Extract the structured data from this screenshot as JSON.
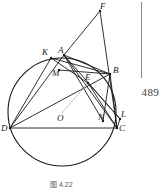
{
  "figure": {
    "caption": "图 4.22",
    "page_number": "489",
    "points": [
      {
        "id": "F",
        "label": "F",
        "x": 100,
        "y": 11,
        "lx": 100,
        "ly": 2,
        "kind": "external-apex"
      },
      {
        "id": "K",
        "label": "K",
        "x": 51,
        "y": 58,
        "lx": 42,
        "ly": 48,
        "kind": "on-circle"
      },
      {
        "id": "A",
        "label": "A",
        "x": 64,
        "y": 55,
        "lx": 58,
        "ly": 46,
        "kind": "on-circle"
      },
      {
        "id": "B",
        "label": "B",
        "x": 110,
        "y": 74,
        "lx": 113,
        "ly": 66,
        "kind": "on-circle"
      },
      {
        "id": "M",
        "label": "M",
        "x": 59,
        "y": 70,
        "lx": 52,
        "ly": 69,
        "kind": "interior"
      },
      {
        "id": "E",
        "label": "E",
        "x": 88,
        "y": 83,
        "lx": 85,
        "ly": 73,
        "kind": "interior"
      },
      {
        "id": "O",
        "label": "O",
        "x": 62,
        "y": 113,
        "lx": 57,
        "ly": 114,
        "kind": "center"
      },
      {
        "id": "N",
        "label": "N",
        "x": 103,
        "y": 121,
        "lx": 98,
        "ly": 113,
        "kind": "interior"
      },
      {
        "id": "L",
        "label": "L",
        "x": 120,
        "y": 119,
        "lx": 121,
        "ly": 110,
        "kind": "external"
      },
      {
        "id": "C",
        "label": "C",
        "x": 117,
        "y": 128,
        "lx": 119,
        "ly": 124,
        "kind": "on-circle"
      },
      {
        "id": "D",
        "label": "D",
        "x": 10,
        "y": 128,
        "lx": 1,
        "ly": 124,
        "kind": "on-circle"
      }
    ],
    "circle": {
      "cx": 62,
      "cy": 112,
      "r": 54,
      "label": "circumcircle"
    },
    "segments": [
      {
        "from": "F",
        "to": "A",
        "style": "solid"
      },
      {
        "from": "F",
        "to": "C",
        "style": "solid"
      },
      {
        "from": "A",
        "to": "B",
        "style": "solid"
      },
      {
        "from": "A",
        "to": "C",
        "style": "solid"
      },
      {
        "from": "A",
        "to": "N",
        "style": "solid"
      },
      {
        "from": "A",
        "to": "L",
        "style": "solid"
      },
      {
        "from": "A",
        "to": "D",
        "style": "solid"
      },
      {
        "from": "K",
        "to": "E",
        "style": "solid"
      },
      {
        "from": "K",
        "to": "B",
        "style": "solid"
      },
      {
        "from": "D",
        "to": "C",
        "style": "solid"
      },
      {
        "from": "D",
        "to": "B",
        "style": "solid"
      },
      {
        "from": "D",
        "to": "K",
        "style": "solid"
      },
      {
        "from": "B",
        "to": "C",
        "style": "solid"
      },
      {
        "from": "B",
        "to": "N",
        "style": "solid"
      },
      {
        "from": "E",
        "to": "C",
        "style": "solid"
      },
      {
        "from": "E",
        "to": "L",
        "style": "solid"
      },
      {
        "from": "M",
        "to": "B",
        "style": "solid"
      },
      {
        "from": "C",
        "to": "L",
        "style": "solid"
      },
      {
        "from": "O",
        "to": "E",
        "style": "dashed"
      }
    ]
  }
}
